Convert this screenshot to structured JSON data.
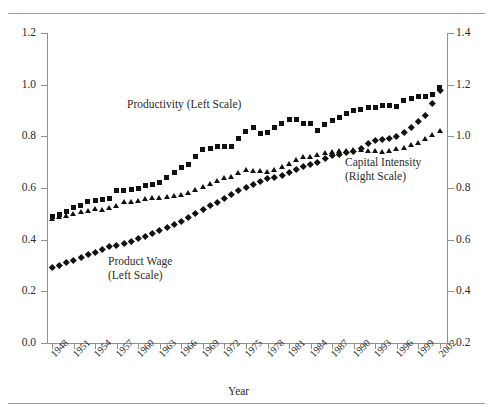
{
  "figure": {
    "has_top_rule": true,
    "has_bottom_rule": true,
    "background": "#ffffff",
    "marker_color": "#111111",
    "axis_color": "#8f8f8f"
  },
  "annotations": {
    "productivity": "Productivity (Left Scale)",
    "product_wage_line1": "Product Wage",
    "product_wage_line2": "(Left Scale)",
    "capital_line1": "Capital Intensity",
    "capital_line2": "(Right Scale)"
  },
  "chart_data": {
    "type": "scatter",
    "title": "",
    "xlabel": "Year",
    "ylabel": "",
    "grid": false,
    "legend_position": "inline-annotations",
    "xlim": [
      1947.3,
      2003.0
    ],
    "x_tick_labels": [
      "1948",
      "1951",
      "1954",
      "1957",
      "1960",
      "1963",
      "1966",
      "1969",
      "1972",
      "1975",
      "1978",
      "1981",
      "1984",
      "1987",
      "1990",
      "1993",
      "1996",
      "1999",
      "2002"
    ],
    "x_tick_values": [
      1948,
      1951,
      1954,
      1957,
      1960,
      1963,
      1966,
      1969,
      1972,
      1975,
      1978,
      1981,
      1984,
      1987,
      1990,
      1993,
      1996,
      1999,
      2002
    ],
    "left_axis": {
      "label": "",
      "ylim": [
        0.0,
        1.2
      ],
      "ticks": [
        0.0,
        0.2,
        0.4,
        0.6,
        0.8,
        1.0,
        1.2
      ],
      "tick_labels": [
        "0.0",
        "0.2",
        "0.4",
        "0.6",
        "0.8",
        "1.0",
        "1.2"
      ]
    },
    "right_axis": {
      "label": "",
      "ylim": [
        0.2,
        1.4
      ],
      "ticks": [
        0.2,
        0.4,
        0.6,
        0.8,
        1.0,
        1.2,
        1.4
      ],
      "tick_labels": [
        "0.2",
        "0.4",
        "0.6",
        "0.8",
        "1.0",
        "1.2",
        "1.4"
      ]
    },
    "x": [
      1948,
      1949,
      1950,
      1951,
      1952,
      1953,
      1954,
      1955,
      1956,
      1957,
      1958,
      1959,
      1960,
      1961,
      1962,
      1963,
      1964,
      1965,
      1966,
      1967,
      1968,
      1969,
      1970,
      1971,
      1972,
      1973,
      1974,
      1975,
      1976,
      1977,
      1978,
      1979,
      1980,
      1981,
      1982,
      1983,
      1984,
      1985,
      1986,
      1987,
      1988,
      1989,
      1990,
      1991,
      1992,
      1993,
      1994,
      1995,
      1996,
      1997,
      1998,
      1999,
      2000,
      2001,
      2002
    ],
    "series": [
      {
        "name": "Productivity (Left Scale)",
        "marker": "square",
        "axis": "left",
        "values": [
          0.49,
          0.497,
          0.51,
          0.524,
          0.534,
          0.547,
          0.553,
          0.556,
          0.56,
          0.592,
          0.592,
          0.595,
          0.599,
          0.61,
          0.613,
          0.622,
          0.64,
          0.661,
          0.678,
          0.692,
          0.722,
          0.75,
          0.752,
          0.759,
          0.762,
          0.762,
          0.79,
          0.818,
          0.835,
          0.812,
          0.815,
          0.835,
          0.85,
          0.866,
          0.866,
          0.848,
          0.848,
          0.822,
          0.845,
          0.861,
          0.875,
          0.888,
          0.9,
          0.904,
          0.911,
          0.91,
          0.918,
          0.921,
          0.914,
          0.94,
          0.946,
          0.956,
          0.954,
          0.963,
          0.99
        ]
      },
      {
        "name": "Capital Intensity (Right Scale)",
        "marker": "triangle",
        "axis": "right",
        "values": [
          0.68,
          0.688,
          0.694,
          0.7,
          0.707,
          0.713,
          0.72,
          0.717,
          0.722,
          0.73,
          0.745,
          0.748,
          0.752,
          0.757,
          0.76,
          0.762,
          0.766,
          0.77,
          0.775,
          0.783,
          0.792,
          0.803,
          0.818,
          0.828,
          0.838,
          0.845,
          0.86,
          0.872,
          0.868,
          0.866,
          0.864,
          0.87,
          0.88,
          0.893,
          0.91,
          0.92,
          0.922,
          0.928,
          0.937,
          0.94,
          0.942,
          0.944,
          0.946,
          0.948,
          0.944,
          0.942,
          0.941,
          0.944,
          0.95,
          0.957,
          0.966,
          0.976,
          0.99,
          1.006,
          1.022
        ]
      },
      {
        "name": "Product Wage (Left Scale)",
        "marker": "diamond",
        "axis": "left",
        "values": [
          0.292,
          0.3,
          0.312,
          0.322,
          0.333,
          0.345,
          0.352,
          0.363,
          0.373,
          0.378,
          0.385,
          0.395,
          0.405,
          0.415,
          0.425,
          0.435,
          0.447,
          0.458,
          0.472,
          0.487,
          0.502,
          0.518,
          0.532,
          0.545,
          0.56,
          0.576,
          0.59,
          0.602,
          0.615,
          0.626,
          0.636,
          0.64,
          0.65,
          0.66,
          0.671,
          0.683,
          0.692,
          0.7,
          0.714,
          0.725,
          0.732,
          0.738,
          0.742,
          0.752,
          0.772,
          0.784,
          0.789,
          0.792,
          0.8,
          0.815,
          0.835,
          0.858,
          0.883,
          0.93,
          0.978
        ]
      }
    ]
  }
}
